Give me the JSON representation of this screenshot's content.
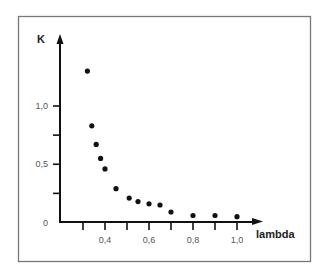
{
  "chart_data": {
    "type": "scatter",
    "title": "",
    "xlabel": "lambda",
    "ylabel": "K",
    "xlim": [
      0.28,
      1.12
    ],
    "ylim": [
      0,
      1.5
    ],
    "grid": false,
    "legend": null,
    "x_ticks": [
      0.3,
      0.4,
      0.5,
      0.6,
      0.7,
      0.8,
      0.9,
      1.0
    ],
    "x_tick_labels": [
      {
        "value": 0.4,
        "label": "0,4"
      },
      {
        "value": 0.6,
        "label": "0,6"
      },
      {
        "value": 0.8,
        "label": "0,8"
      },
      {
        "value": 1.0,
        "label": "1,0"
      }
    ],
    "y_ticks": [
      0,
      0.25,
      0.5,
      0.75,
      1.0
    ],
    "y_tick_labels": [
      {
        "value": 0,
        "label": "0"
      },
      {
        "value": 0.5,
        "label": "0,5"
      },
      {
        "value": 1.0,
        "label": "1,0"
      }
    ],
    "series": [
      {
        "name": "K vs lambda",
        "x": [
          0.32,
          0.34,
          0.36,
          0.38,
          0.4,
          0.45,
          0.51,
          0.55,
          0.6,
          0.65,
          0.7,
          0.8,
          0.9,
          1.0
        ],
        "y": [
          1.3,
          0.83,
          0.67,
          0.55,
          0.46,
          0.29,
          0.21,
          0.18,
          0.16,
          0.15,
          0.09,
          0.06,
          0.06,
          0.05
        ]
      }
    ]
  },
  "labels": {
    "y_axis": "K",
    "x_axis": "lambda"
  }
}
